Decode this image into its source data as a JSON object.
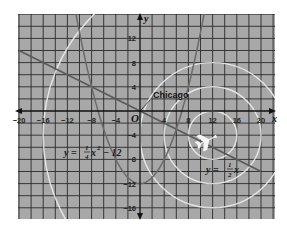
{
  "chart_data": {
    "type": "line",
    "title": "",
    "xlabel": "x",
    "ylabel": "y",
    "origin_label": "O",
    "xlim": [
      -20,
      20
    ],
    "ylim": [
      -17,
      16
    ],
    "grid": true,
    "grid_step": 2,
    "x_ticks": [
      -20,
      -16,
      -12,
      -8,
      -4,
      4,
      8,
      12,
      16,
      20
    ],
    "y_ticks": [
      12,
      8,
      4,
      -4,
      -8,
      -12,
      -16
    ],
    "series": [
      {
        "name": "line",
        "label": "y = 1/2 x",
        "label_parts": {
          "lhs": "y =",
          "num": "1",
          "den": "2",
          "var": "x"
        },
        "equation": "y = -0.5x",
        "color": "#5a5a5a",
        "points": [
          [
            -20,
            10
          ],
          [
            0,
            0
          ],
          [
            20,
            -10
          ]
        ]
      },
      {
        "name": "parabola",
        "label": "y = 1/4 x^2 - 12",
        "label_parts": {
          "lhs": "y =",
          "num": "1",
          "den": "4",
          "var": "x",
          "exp": "2",
          "rest": "− 12"
        },
        "equation": "y = 0.25x^2 - 12",
        "color": "#6a6a6a",
        "points": [
          [
            -10,
            13
          ],
          [
            -8,
            4
          ],
          [
            -6,
            -3
          ],
          [
            -4,
            -8
          ],
          [
            -2,
            -11
          ],
          [
            0,
            -12
          ],
          [
            2,
            -11
          ],
          [
            4,
            -8
          ],
          [
            6,
            -3
          ],
          [
            8,
            4
          ],
          [
            10,
            13
          ]
        ]
      },
      {
        "name": "radar-circles",
        "type": "circles",
        "color": "#f2f2f2",
        "center": [
          12,
          -4
        ],
        "radii": [
          4,
          8,
          12,
          28
        ]
      }
    ],
    "annotations": [
      {
        "text": "Chicago",
        "x": 0,
        "y": 0,
        "label_at": [
          2,
          4
        ]
      },
      {
        "text": "airplane-icon",
        "x": 11,
        "y": -5
      }
    ]
  },
  "colors": {
    "grid_bg": "#a8a8a8",
    "grid_line": "#2a2a2a",
    "circle": "#f2f2f2"
  }
}
